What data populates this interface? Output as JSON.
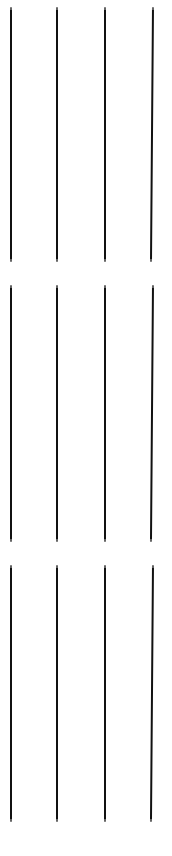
{
  "figure": {
    "type": "line-strokes",
    "canvas": {
      "width": 172,
      "height": 856,
      "background_color": "#ffffff"
    },
    "stroke_color": "#111111",
    "stroke_width": 2,
    "group_count": 3,
    "strokes_per_group": 4,
    "total_strokes": 12,
    "groups": [
      {
        "name": "group-1",
        "top": 7,
        "height": 255,
        "strokes": [
          {
            "name": "stroke-1",
            "x": 10,
            "width": 2,
            "slant": 0
          },
          {
            "name": "stroke-2",
            "x": 56,
            "width": 2,
            "slant": 0
          },
          {
            "name": "stroke-3",
            "x": 104,
            "width": 2,
            "slant": 0
          },
          {
            "name": "stroke-4",
            "x": 152,
            "width": 2,
            "slant": -0.45
          }
        ]
      },
      {
        "name": "group-2",
        "top": 285,
        "height": 257,
        "strokes": [
          {
            "name": "stroke-1",
            "x": 10,
            "width": 2,
            "slant": 0
          },
          {
            "name": "stroke-2",
            "x": 56,
            "width": 2,
            "slant": 0
          },
          {
            "name": "stroke-3",
            "x": 104,
            "width": 2,
            "slant": 0
          },
          {
            "name": "stroke-4",
            "x": 152,
            "width": 2,
            "slant": -0.45
          }
        ]
      },
      {
        "name": "group-3",
        "top": 565,
        "height": 257,
        "strokes": [
          {
            "name": "stroke-1",
            "x": 10,
            "width": 2,
            "slant": 0
          },
          {
            "name": "stroke-2",
            "x": 56,
            "width": 2,
            "slant": 0
          },
          {
            "name": "stroke-3",
            "x": 104,
            "width": 2,
            "slant": 0
          },
          {
            "name": "stroke-4",
            "x": 152,
            "width": 2,
            "slant": -0.45
          }
        ]
      }
    ]
  }
}
